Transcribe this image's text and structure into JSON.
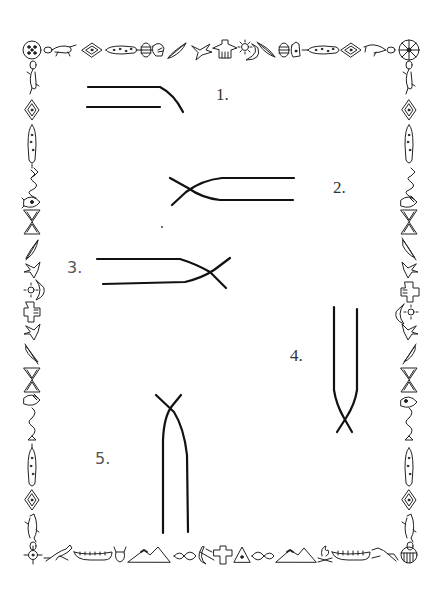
{
  "page": {
    "type": "illustrated worksheet",
    "background": "#ffffff",
    "ink_color": "#111111"
  },
  "border": {
    "style": "native-american pictograph frame",
    "top": [
      "shield-circle",
      "lizard",
      "diamond",
      "beaded-stick",
      "striped-egg",
      "hand",
      "feather",
      "bird",
      "thunderbird",
      "sun",
      "moon",
      "feather",
      "striped-egg",
      "hand",
      "beaded-stick",
      "diamond",
      "lizard",
      "medicine-wheel"
    ],
    "left": [
      "lizard",
      "diamond",
      "beaded-stick",
      "snake",
      "fish",
      "hourglass-pattern",
      "feather",
      "bird",
      "sun-moon",
      "thunderbird",
      "bird",
      "feather",
      "hourglass-pattern",
      "fish",
      "snake",
      "beaded-stick",
      "diamond",
      "lizard"
    ],
    "right": [
      "lizard",
      "diamond",
      "beaded-stick",
      "snake",
      "fish",
      "hourglass-pattern",
      "feather",
      "bird",
      "thunderbird",
      "sun-moon",
      "bird",
      "feather",
      "hourglass-pattern",
      "fish",
      "snake",
      "beaded-stick",
      "diamond",
      "lizard"
    ],
    "bottom": [
      "zia-sun",
      "horse",
      "canoe",
      "buffalo-head",
      "mountains",
      "leaves",
      "moon-bow",
      "thunderbird",
      "teepee",
      "leaves",
      "mountains",
      "campfire",
      "canoe",
      "horse",
      "shield"
    ]
  },
  "figures": [
    {
      "number": "1.",
      "description": "two parallel horizontal lines, top line curves downward at right end"
    },
    {
      "number": "2.",
      "description": "two parallel horizontal lines that cross at the left end"
    },
    {
      "number": "3.",
      "description": "two parallel horizontal lines that cross at the right end"
    },
    {
      "number": "4.",
      "description": "two parallel vertical lines that cross at the bottom end"
    },
    {
      "number": "5.",
      "description": "two parallel vertical lines that cross at the top end"
    }
  ]
}
